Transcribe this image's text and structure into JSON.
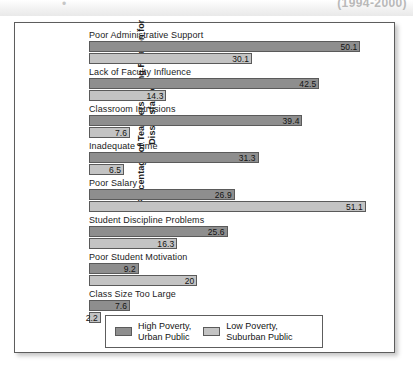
{
  "top_caption": {
    "truncated_text": "(1994-2000)",
    "bullet": "•"
  },
  "chart_data": {
    "type": "bar",
    "orientation": "horizontal",
    "title": "",
    "xlabel": "",
    "ylabel": "Percentage of Teachers Giving Reason for Dissatisfaction",
    "xlim": [
      0,
      55
    ],
    "grid": false,
    "legend_position": "bottom",
    "categories": [
      "Poor Administrative Support",
      "Lack of Faculty Influence",
      "Classroom Intrusions",
      "Inadequate Time",
      "Poor Salary",
      "Student Discipline Problems",
      "Poor Student Motivation",
      "Class Size Too Large"
    ],
    "series": [
      {
        "name": "High Poverty, Urban Public",
        "color": "#8e8e8e",
        "values": [
          50.1,
          42.5,
          39.4,
          31.3,
          26.9,
          25.6,
          9.2,
          7.6
        ],
        "labels": [
          "50.1",
          "42.5",
          "39.4",
          "31.3",
          "26.9",
          "25.6",
          "9.2",
          "7.6"
        ]
      },
      {
        "name": "Low Poverty, Suburban Public",
        "color": "#c3c3c3",
        "values": [
          30.1,
          14.3,
          7.6,
          6.5,
          51.1,
          16.3,
          20,
          2.2
        ],
        "labels": [
          "30.1",
          "14.3",
          "7.6",
          "6.5",
          "51.1",
          "16.3",
          "20",
          "2.2"
        ]
      }
    ]
  },
  "legend": {
    "entries": [
      {
        "label_line1": "High Poverty,",
        "label_line2": "Urban Public",
        "swatch": "high"
      },
      {
        "label_line1": "Low Poverty,",
        "label_line2": "Suburban Public",
        "swatch": "low"
      }
    ]
  }
}
